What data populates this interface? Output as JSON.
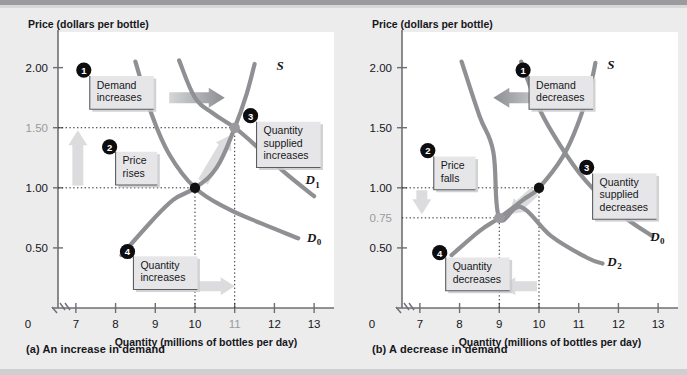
{
  "figure": {
    "background": "#ececed",
    "plot_background": "#ffffff",
    "curve_color": "#8f9093",
    "dot_color": "#111111",
    "new_dot_color": "#9a9a9e",
    "arrow_color": "#b9babd",
    "pale_arrow_color": "#dcdcde",
    "highlight_label_color": "#9a9a9e"
  },
  "chart_data": [
    {
      "type": "line",
      "panel": "a",
      "caption": "(a)  An increase in demand",
      "title": "Price (dollars per bottle)",
      "ylabel": "Price (dollars per bottle)",
      "xlabel": "Quantity (millions of bottles per day)",
      "xlim": [
        6.55,
        13.4
      ],
      "ylim": [
        0,
        2.18
      ],
      "xticks": [
        7,
        8,
        9,
        10,
        11,
        12,
        13
      ],
      "xticklabels": [
        "7",
        "8",
        "9",
        "10",
        "11",
        "12",
        "13"
      ],
      "x_origin_label": "0",
      "highlight_xtick": "11",
      "yticks": [
        0.5,
        1.0,
        1.5,
        2.0
      ],
      "yticklabels": [
        "0.50",
        "1.00",
        "1.50",
        "2.00"
      ],
      "highlight_ytick": "1.50",
      "axis_break": true,
      "grid": false,
      "series": [
        {
          "name": "S",
          "label": "S",
          "label_pos": [
            12.05,
            1.98
          ],
          "points": [
            [
              8.15,
              0.44
            ],
            [
              8.9,
              0.72
            ],
            [
              9.45,
              0.9
            ],
            [
              10.0,
              1.0
            ],
            [
              10.55,
              1.17
            ],
            [
              11.0,
              1.5
            ],
            [
              11.3,
              1.78
            ],
            [
              11.5,
              2.03
            ]
          ]
        },
        {
          "name": "D0",
          "label": "D",
          "label_sub": "0",
          "label_pos": [
            12.82,
            0.55
          ],
          "points": [
            [
              8.5,
              2.05
            ],
            [
              8.9,
              1.62
            ],
            [
              9.35,
              1.28
            ],
            [
              10.0,
              1.0
            ],
            [
              10.8,
              0.83
            ],
            [
              11.7,
              0.7
            ],
            [
              12.6,
              0.58
            ]
          ]
        },
        {
          "name": "D1",
          "label": "D",
          "label_sub": "1",
          "label_pos": [
            12.78,
            1.03
          ],
          "points": [
            [
              9.6,
              2.06
            ],
            [
              10.0,
              1.75
            ],
            [
              10.45,
              1.62
            ],
            [
              11.0,
              1.5
            ],
            [
              11.6,
              1.33
            ],
            [
              12.25,
              1.13
            ],
            [
              13.0,
              0.93
            ]
          ]
        }
      ],
      "equilibria": [
        {
          "name": "initial",
          "x": 10,
          "y": 1.0,
          "style": "filled-black"
        },
        {
          "name": "new",
          "x": 11,
          "y": 1.5,
          "style": "filled-gray"
        }
      ],
      "dotted_guides": [
        {
          "from": [
            6.55,
            1.0
          ],
          "to": [
            10,
            1.0
          ],
          "orient": "h"
        },
        {
          "from": [
            6.55,
            1.5
          ],
          "to": [
            11,
            1.5
          ],
          "orient": "h"
        },
        {
          "from": [
            10,
            0
          ],
          "to": [
            10,
            1.0
          ],
          "orient": "v"
        },
        {
          "from": [
            11,
            0
          ],
          "to": [
            11,
            1.5
          ],
          "orient": "v"
        }
      ],
      "annotations": [
        {
          "num": "1",
          "text": "Demand\nincreases",
          "box": [
            7.35,
            1.93
          ],
          "num_pos": [
            7.2,
            1.98
          ]
        },
        {
          "num": "2",
          "text": "Price\nrises",
          "box": [
            8.0,
            1.3
          ],
          "num_pos": [
            7.85,
            1.34
          ]
        },
        {
          "num": "3",
          "text": "Quantity\nsupplied\nincreases",
          "box": [
            11.55,
            1.55
          ],
          "num_pos": [
            11.4,
            1.6
          ]
        },
        {
          "num": "4",
          "text": "Quantity\nincreases",
          "box": [
            8.45,
            0.43
          ],
          "num_pos": [
            8.3,
            0.47
          ]
        }
      ],
      "shift_arrows": [
        {
          "name": "demand-shift-arrow",
          "dir": "right",
          "strong": true,
          "from": [
            9.35,
            1.75
          ],
          "to": [
            10.75,
            1.75
          ]
        },
        {
          "name": "price-rise-arrow",
          "dir": "up",
          "strong": false,
          "x": 7.05,
          "from_y": 1.02,
          "to_y": 1.48
        },
        {
          "name": "quantity-supplied-arrow",
          "dir": "up-right",
          "strong": false,
          "from": [
            10.2,
            1.05
          ],
          "to": [
            10.9,
            1.44
          ]
        },
        {
          "name": "quantity-increase-arrow",
          "dir": "right",
          "strong": false,
          "from": [
            10.1,
            0.18
          ],
          "to": [
            11.0,
            0.18
          ]
        }
      ]
    },
    {
      "type": "line",
      "panel": "b",
      "caption": "(b)  A decrease in demand",
      "title": "Price (dollars per bottle)",
      "ylabel": "Price (dollars per bottle)",
      "xlabel": "Quantity (millions of bottles per day)",
      "xlim": [
        6.55,
        13.4
      ],
      "ylim": [
        0,
        2.18
      ],
      "xticks": [
        7,
        8,
        9,
        10,
        11,
        12,
        13
      ],
      "xticklabels": [
        "7",
        "8",
        "9",
        "10",
        "11",
        "12",
        "13"
      ],
      "x_origin_label": "0",
      "highlight_xtick": null,
      "yticks": [
        0.5,
        1.0,
        1.5,
        2.0
      ],
      "yticklabels": [
        "0.50",
        "1.00",
        "1.50",
        "2.00"
      ],
      "extra_ytick": {
        "value": 0.75,
        "label": "0.75",
        "highlight": true
      },
      "axis_break": true,
      "grid": false,
      "series": [
        {
          "name": "S",
          "label": "S",
          "label_pos": [
            11.72,
            1.99
          ],
          "points": [
            [
              7.8,
              0.44
            ],
            [
              8.5,
              0.64
            ],
            [
              9.0,
              0.75
            ],
            [
              9.6,
              0.9
            ],
            [
              10.0,
              1.0
            ],
            [
              10.6,
              1.26
            ],
            [
              11.0,
              1.55
            ],
            [
              11.3,
              1.86
            ],
            [
              11.42,
              2.04
            ]
          ]
        },
        {
          "name": "D0",
          "label": "D",
          "label_sub": "0",
          "label_pos": [
            12.8,
            0.56
          ],
          "points": [
            [
              9.55,
              2.05
            ],
            [
              9.95,
              1.7
            ],
            [
              10.35,
              1.45
            ],
            [
              11.0,
              1.13
            ],
            [
              11.7,
              0.88
            ],
            [
              12.3,
              0.72
            ],
            [
              12.85,
              0.6
            ]
          ]
        },
        {
          "name": "D2",
          "label": "D",
          "label_sub": "2",
          "label_pos": [
            11.72,
            0.35
          ],
          "points": [
            [
              8.05,
              2.05
            ],
            [
              8.5,
              1.6
            ],
            [
              8.85,
              1.3
            ],
            [
              9.0,
              0.75
            ],
            [
              9.55,
              0.84
            ],
            [
              10.3,
              0.6
            ],
            [
              11.2,
              0.42
            ],
            [
              11.6,
              0.37
            ]
          ]
        }
      ],
      "equilibria": [
        {
          "name": "initial",
          "x": 10,
          "y": 1.0,
          "style": "filled-black"
        },
        {
          "name": "new",
          "x": 9,
          "y": 0.75,
          "style": "filled-gray"
        }
      ],
      "dotted_guides": [
        {
          "from": [
            6.55,
            1.0
          ],
          "to": [
            10,
            1.0
          ],
          "orient": "h"
        },
        {
          "from": [
            6.55,
            0.75
          ],
          "to": [
            9,
            0.75
          ],
          "orient": "h"
        },
        {
          "from": [
            10,
            0
          ],
          "to": [
            10,
            1.0
          ],
          "orient": "v"
        },
        {
          "from": [
            9,
            0
          ],
          "to": [
            9,
            0.75
          ],
          "orient": "v"
        }
      ],
      "annotations": [
        {
          "num": "1",
          "text": "Demand\ndecreases",
          "box": [
            9.75,
            1.93
          ],
          "num_pos": [
            9.6,
            1.98
          ]
        },
        {
          "num": "2",
          "text": "Price\nfalls",
          "box": [
            7.35,
            1.26
          ],
          "num_pos": [
            7.2,
            1.31
          ]
        },
        {
          "num": "3",
          "text": "Quantity\nsupplied\ndecreases",
          "box": [
            11.35,
            1.12
          ],
          "num_pos": [
            11.2,
            1.17
          ]
        },
        {
          "num": "4",
          "text": "Quantity\ndecreases",
          "box": [
            7.65,
            0.42
          ],
          "num_pos": [
            7.5,
            0.46
          ]
        }
      ],
      "shift_arrows": [
        {
          "name": "demand-shift-arrow",
          "dir": "left",
          "strong": true,
          "from": [
            10.2,
            1.75
          ],
          "to": [
            8.85,
            1.75
          ]
        },
        {
          "name": "price-fall-arrow",
          "dir": "down",
          "strong": false,
          "x": 7.05,
          "from_y": 0.98,
          "to_y": 0.78
        },
        {
          "name": "quantity-supplied-arrow",
          "dir": "down-left",
          "strong": false,
          "from": [
            9.9,
            0.97
          ],
          "to": [
            9.25,
            0.78
          ]
        },
        {
          "name": "quantity-decrease-arrow",
          "dir": "left",
          "strong": false,
          "from": [
            9.95,
            0.18
          ],
          "to": [
            9.05,
            0.18
          ]
        }
      ]
    }
  ]
}
